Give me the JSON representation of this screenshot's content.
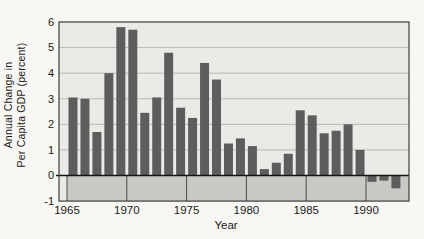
{
  "chart_data": {
    "type": "bar",
    "title": "",
    "xlabel": "Year",
    "ylabel_line1": "Annual Change in",
    "ylabel_line2": "Per Capita GDP (percent)",
    "x": [
      1965,
      1966,
      1967,
      1968,
      1969,
      1970,
      1971,
      1972,
      1973,
      1974,
      1975,
      1976,
      1977,
      1978,
      1979,
      1980,
      1981,
      1982,
      1983,
      1984,
      1985,
      1986,
      1987,
      1988,
      1989,
      1990,
      1991,
      1992
    ],
    "values": [
      3.05,
      3.0,
      1.7,
      4.0,
      5.8,
      5.7,
      2.45,
      3.05,
      4.8,
      2.65,
      2.25,
      4.4,
      3.75,
      1.25,
      1.45,
      1.15,
      0.25,
      0.5,
      0.85,
      2.55,
      2.35,
      1.65,
      1.75,
      2.0,
      1.0,
      -0.25,
      -0.2,
      -0.5
    ],
    "x_ticks": [
      1965,
      1970,
      1975,
      1980,
      1985,
      1990
    ],
    "y_ticks": [
      6,
      5,
      4,
      3,
      2,
      1,
      0,
      -1
    ],
    "grid_values": [
      1,
      2,
      3,
      4,
      5
    ],
    "ylim": [
      -1,
      6
    ],
    "legend": "none",
    "grid": "horizontal-above-zero",
    "colors": {
      "bar": "#5d5d5d",
      "plot_bg": "#ebeae7",
      "below_zero_band": "#c9c8c4",
      "grid": "#b3b2af",
      "frame": "#3c3c3c",
      "zero_line": "#141414",
      "tick_line": "#4a4a4a",
      "page_bg": "#f8f7f4",
      "text": "#1a1a1a"
    }
  }
}
